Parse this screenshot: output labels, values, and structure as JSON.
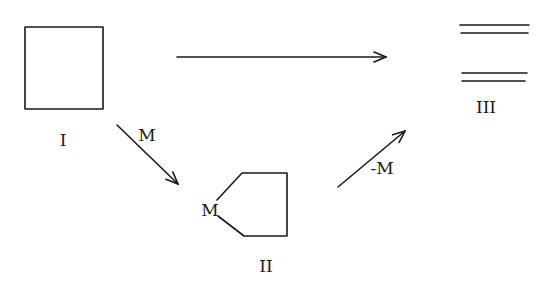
{
  "diagram": {
    "nodes": [
      {
        "id": "I",
        "label": "I",
        "shape": "square"
      },
      {
        "id": "II",
        "label": "II",
        "shape": "pentagon-with-M",
        "vertex_label": "M"
      },
      {
        "id": "III",
        "label": "III",
        "shape": "two-double-lines"
      }
    ],
    "edges": [
      {
        "from": "I",
        "to": "III",
        "label": ""
      },
      {
        "from": "I",
        "to": "II",
        "label": "M"
      },
      {
        "from": "II",
        "to": "III",
        "label": "-M"
      }
    ]
  },
  "labels": {
    "node_I": "I",
    "node_II": "II",
    "node_III": "III",
    "vertex_M": "M",
    "edge_I_II": "M",
    "edge_II_III": "-M"
  },
  "colors": {
    "stroke": "#1a1a1a",
    "background": "#ffffff"
  }
}
